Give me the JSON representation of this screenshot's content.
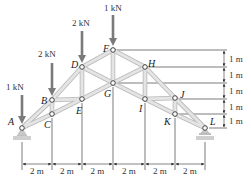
{
  "figure": {
    "type": "roof-truss",
    "background": "#ffffff",
    "member_color": "#d6d6d6",
    "member_edge_color": "#b8b8b8",
    "load_arrow_color": "#7a7a7a",
    "line_color": "#444444"
  },
  "nodes": [
    {
      "id": "A",
      "label": "A",
      "x": 22,
      "y": 128,
      "lx": 8,
      "ly": 125
    },
    {
      "id": "B",
      "label": "B",
      "x": 52,
      "y": 100,
      "lx": 41,
      "ly": 104
    },
    {
      "id": "C",
      "label": "C",
      "x": 52,
      "y": 114,
      "lx": 44,
      "ly": 128
    },
    {
      "id": "D",
      "label": "D",
      "x": 82,
      "y": 67,
      "lx": 71,
      "ly": 68
    },
    {
      "id": "E",
      "label": "E",
      "x": 82,
      "y": 99,
      "lx": 76,
      "ly": 114
    },
    {
      "id": "F",
      "label": "F",
      "x": 113,
      "y": 50,
      "lx": 103,
      "ly": 52
    },
    {
      "id": "G",
      "label": "G",
      "x": 113,
      "y": 83,
      "lx": 104,
      "ly": 97
    },
    {
      "id": "H",
      "label": "H",
      "x": 145,
      "y": 67,
      "lx": 148,
      "ly": 67
    },
    {
      "id": "I",
      "label": "I",
      "x": 145,
      "y": 99,
      "lx": 139,
      "ly": 112
    },
    {
      "id": "J",
      "label": "J",
      "x": 175,
      "y": 98,
      "lx": 180,
      "ly": 98
    },
    {
      "id": "K",
      "label": "K",
      "x": 175,
      "y": 114,
      "lx": 164,
      "ly": 125
    },
    {
      "id": "L",
      "label": "L",
      "x": 205,
      "y": 128,
      "lx": 210,
      "ly": 125
    }
  ],
  "members": [
    [
      "A",
      "B"
    ],
    [
      "B",
      "D"
    ],
    [
      "D",
      "F"
    ],
    [
      "F",
      "H"
    ],
    [
      "H",
      "J"
    ],
    [
      "J",
      "L"
    ],
    [
      "A",
      "C"
    ],
    [
      "C",
      "E"
    ],
    [
      "E",
      "G"
    ],
    [
      "G",
      "I"
    ],
    [
      "I",
      "K"
    ],
    [
      "K",
      "L"
    ],
    [
      "B",
      "C"
    ],
    [
      "B",
      "E"
    ],
    [
      "D",
      "E"
    ],
    [
      "D",
      "G"
    ],
    [
      "F",
      "G"
    ],
    [
      "G",
      "H"
    ],
    [
      "H",
      "I"
    ],
    [
      "I",
      "J"
    ],
    [
      "J",
      "K"
    ]
  ],
  "loads": [
    {
      "node": "A",
      "label": "1 kN",
      "x": 22,
      "y_top": 95,
      "y_tip": 124,
      "lx": 6,
      "ly": 90
    },
    {
      "node": "B",
      "label": "2 kN",
      "x": 52,
      "y_top": 63,
      "y_tip": 96,
      "lx": 38,
      "ly": 57
    },
    {
      "node": "D",
      "label": "2 kN",
      "x": 82,
      "y_top": 31,
      "y_tip": 63,
      "lx": 72,
      "ly": 26
    },
    {
      "node": "F",
      "label": "1 kN",
      "x": 113,
      "y_top": 15,
      "y_tip": 46,
      "lx": 104,
      "ly": 11
    }
  ],
  "supports": [
    {
      "node": "A",
      "type": "pin",
      "x": 22,
      "y": 128
    },
    {
      "node": "L",
      "type": "roller",
      "x": 205,
      "y": 128
    }
  ],
  "dimensions": {
    "horizontal": {
      "y_arrow": 164,
      "y_label": 174,
      "ticks_x": [
        22,
        52,
        82,
        113,
        145,
        175,
        205
      ],
      "labels": [
        "2 m",
        "2 m",
        "2 m",
        "2 m",
        "2 m",
        "2 m"
      ]
    },
    "vertical": {
      "x_arrow": 224,
      "x_label": 229,
      "levels_y": [
        50,
        67,
        83,
        99,
        114,
        128
      ],
      "ext_start_x": [
        113,
        145,
        113,
        175,
        175,
        205
      ],
      "labels": [
        "1 m",
        "1 m",
        "1 m",
        "1 m",
        "1 m"
      ]
    }
  }
}
